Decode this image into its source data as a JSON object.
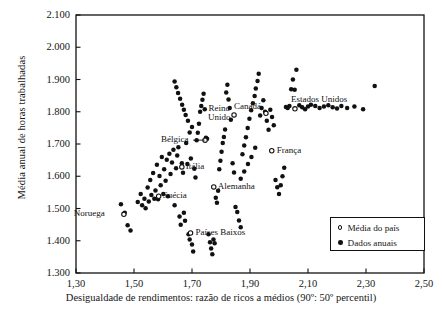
{
  "chart_data": {
    "type": "scatter",
    "title": "",
    "xlabel": "Desigualdade de rendimentos: razão de ricos a médios (90º: 50º percentil)",
    "ylabel": "Média anual de horas trabalhadas",
    "xlim": [
      1.3,
      2.5
    ],
    "ylim": [
      1300,
      2100
    ],
    "xticks": [
      "1,30",
      "1,50",
      "1,70",
      "1,90",
      "2,10",
      "2,30",
      "2,50"
    ],
    "xtick_values": [
      1.3,
      1.5,
      1.7,
      1.9,
      2.1,
      2.3,
      2.5
    ],
    "yticks": [
      "1.300",
      "1.400",
      "1.500",
      "1.600",
      "1.700",
      "1.800",
      "1.900",
      "2.000",
      "2.100"
    ],
    "ytick_values": [
      1300,
      1400,
      1500,
      1600,
      1700,
      1800,
      1900,
      2000,
      2100
    ],
    "grid": false,
    "legend_position": "bottom-right",
    "legend": [
      {
        "marker": "open-circle",
        "label": "Média do país"
      },
      {
        "marker": "filled-circle",
        "label": "Dados anuais"
      }
    ],
    "country_means": [
      {
        "name": "Noruega",
        "x": 1.465,
        "y": 1482,
        "label_side": "left"
      },
      {
        "name": "Suécia",
        "x": 1.585,
        "y": 1538,
        "label_side": "right"
      },
      {
        "name": "Itália",
        "x": 1.665,
        "y": 1629,
        "label_side": "right"
      },
      {
        "name": "Bélgica",
        "x": 1.745,
        "y": 1712,
        "label_side": "left"
      },
      {
        "name": "Países Baixos",
        "x": 1.695,
        "y": 1424,
        "label_side": "right"
      },
      {
        "name": "Alemanha",
        "x": 1.775,
        "y": 1567,
        "label_side": "right"
      },
      {
        "name": "Reino Unido",
        "x": 1.845,
        "y": 1790,
        "label_side": "left"
      },
      {
        "name": "Canadá",
        "x": 1.955,
        "y": 1795,
        "label_side": "left"
      },
      {
        "name": "França",
        "x": 1.975,
        "y": 1679,
        "label_side": "right"
      },
      {
        "name": "Estados Unidos",
        "x": 2.055,
        "y": 1809,
        "label_side": "right"
      }
    ],
    "annual_points": [
      {
        "x": 1.455,
        "y": 1513
      },
      {
        "x": 1.468,
        "y": 1487
      },
      {
        "x": 1.478,
        "y": 1448
      },
      {
        "x": 1.488,
        "y": 1432
      },
      {
        "x": 1.513,
        "y": 1520
      },
      {
        "x": 1.523,
        "y": 1545
      },
      {
        "x": 1.528,
        "y": 1510
      },
      {
        "x": 1.536,
        "y": 1530
      },
      {
        "x": 1.54,
        "y": 1501
      },
      {
        "x": 1.547,
        "y": 1565
      },
      {
        "x": 1.551,
        "y": 1522
      },
      {
        "x": 1.556,
        "y": 1588
      },
      {
        "x": 1.56,
        "y": 1542
      },
      {
        "x": 1.566,
        "y": 1610
      },
      {
        "x": 1.57,
        "y": 1530
      },
      {
        "x": 1.574,
        "y": 1556
      },
      {
        "x": 1.579,
        "y": 1636
      },
      {
        "x": 1.583,
        "y": 1529
      },
      {
        "x": 1.588,
        "y": 1601
      },
      {
        "x": 1.592,
        "y": 1572
      },
      {
        "x": 1.596,
        "y": 1660
      },
      {
        "x": 1.601,
        "y": 1545
      },
      {
        "x": 1.604,
        "y": 1622
      },
      {
        "x": 1.609,
        "y": 1586
      },
      {
        "x": 1.613,
        "y": 1651
      },
      {
        "x": 1.617,
        "y": 1538
      },
      {
        "x": 1.622,
        "y": 1670
      },
      {
        "x": 1.626,
        "y": 1607
      },
      {
        "x": 1.631,
        "y": 1643
      },
      {
        "x": 1.636,
        "y": 1682
      },
      {
        "x": 1.64,
        "y": 1510
      },
      {
        "x": 1.645,
        "y": 1625
      },
      {
        "x": 1.649,
        "y": 1664
      },
      {
        "x": 1.653,
        "y": 1690
      },
      {
        "x": 1.657,
        "y": 1475
      },
      {
        "x": 1.661,
        "y": 1450
      },
      {
        "x": 1.665,
        "y": 1640
      },
      {
        "x": 1.669,
        "y": 1611
      },
      {
        "x": 1.672,
        "y": 1487
      },
      {
        "x": 1.676,
        "y": 1462
      },
      {
        "x": 1.68,
        "y": 1703
      },
      {
        "x": 1.684,
        "y": 1638
      },
      {
        "x": 1.688,
        "y": 1420
      },
      {
        "x": 1.692,
        "y": 1404
      },
      {
        "x": 1.696,
        "y": 1655
      },
      {
        "x": 1.7,
        "y": 1388
      },
      {
        "x": 1.704,
        "y": 1367
      },
      {
        "x": 1.708,
        "y": 1623
      },
      {
        "x": 1.712,
        "y": 1596
      },
      {
        "x": 1.716,
        "y": 1712
      },
      {
        "x": 1.72,
        "y": 1735
      },
      {
        "x": 1.724,
        "y": 1763
      },
      {
        "x": 1.728,
        "y": 1800
      },
      {
        "x": 1.732,
        "y": 1818
      },
      {
        "x": 1.736,
        "y": 1837
      },
      {
        "x": 1.74,
        "y": 1856
      },
      {
        "x": 1.744,
        "y": 1808
      },
      {
        "x": 1.748,
        "y": 1719
      },
      {
        "x": 1.752,
        "y": 1716
      },
      {
        "x": 1.757,
        "y": 1420
      },
      {
        "x": 1.762,
        "y": 1395
      },
      {
        "x": 1.766,
        "y": 1376
      },
      {
        "x": 1.77,
        "y": 1358
      },
      {
        "x": 1.774,
        "y": 1404
      },
      {
        "x": 1.778,
        "y": 1392
      },
      {
        "x": 1.782,
        "y": 1533
      },
      {
        "x": 1.786,
        "y": 1518
      },
      {
        "x": 1.79,
        "y": 1555
      },
      {
        "x": 1.794,
        "y": 1622
      },
      {
        "x": 1.798,
        "y": 1648
      },
      {
        "x": 1.802,
        "y": 1676
      },
      {
        "x": 1.806,
        "y": 1703
      },
      {
        "x": 1.81,
        "y": 1722
      },
      {
        "x": 1.814,
        "y": 1745
      },
      {
        "x": 1.818,
        "y": 1860
      },
      {
        "x": 1.822,
        "y": 1884
      },
      {
        "x": 1.826,
        "y": 1838
      },
      {
        "x": 1.83,
        "y": 1812
      },
      {
        "x": 1.834,
        "y": 1775
      },
      {
        "x": 1.84,
        "y": 1640
      },
      {
        "x": 1.845,
        "y": 1612
      },
      {
        "x": 1.85,
        "y": 1505
      },
      {
        "x": 1.856,
        "y": 1489
      },
      {
        "x": 1.862,
        "y": 1463
      },
      {
        "x": 1.868,
        "y": 1442
      },
      {
        "x": 1.874,
        "y": 1668
      },
      {
        "x": 1.88,
        "y": 1695
      },
      {
        "x": 1.886,
        "y": 1721
      },
      {
        "x": 1.892,
        "y": 1750
      },
      {
        "x": 1.898,
        "y": 1778
      },
      {
        "x": 1.904,
        "y": 1805
      },
      {
        "x": 1.91,
        "y": 1826
      },
      {
        "x": 1.916,
        "y": 1849
      },
      {
        "x": 1.92,
        "y": 1872
      },
      {
        "x": 1.926,
        "y": 1895
      },
      {
        "x": 1.93,
        "y": 1918
      },
      {
        "x": 1.935,
        "y": 1788
      },
      {
        "x": 1.94,
        "y": 1812
      },
      {
        "x": 1.946,
        "y": 1836
      },
      {
        "x": 1.952,
        "y": 1800
      },
      {
        "x": 1.958,
        "y": 1772
      },
      {
        "x": 1.964,
        "y": 1744
      },
      {
        "x": 1.97,
        "y": 1806
      },
      {
        "x": 1.976,
        "y": 1784
      },
      {
        "x": 1.982,
        "y": 1758
      },
      {
        "x": 1.988,
        "y": 1588
      },
      {
        "x": 1.994,
        "y": 1566
      },
      {
        "x": 2.0,
        "y": 1545
      },
      {
        "x": 2.006,
        "y": 1572
      },
      {
        "x": 2.012,
        "y": 1600
      },
      {
        "x": 2.018,
        "y": 1626
      },
      {
        "x": 2.024,
        "y": 1815
      },
      {
        "x": 2.03,
        "y": 1812
      },
      {
        "x": 2.036,
        "y": 1818
      },
      {
        "x": 2.042,
        "y": 1870
      },
      {
        "x": 2.048,
        "y": 1900
      },
      {
        "x": 2.054,
        "y": 1868
      },
      {
        "x": 2.06,
        "y": 1930
      },
      {
        "x": 2.07,
        "y": 1820
      },
      {
        "x": 2.08,
        "y": 1814
      },
      {
        "x": 2.09,
        "y": 1808
      },
      {
        "x": 2.1,
        "y": 1816
      },
      {
        "x": 2.11,
        "y": 1822
      },
      {
        "x": 2.125,
        "y": 1818
      },
      {
        "x": 2.14,
        "y": 1812
      },
      {
        "x": 2.155,
        "y": 1816
      },
      {
        "x": 2.17,
        "y": 1820
      },
      {
        "x": 2.185,
        "y": 1814
      },
      {
        "x": 2.2,
        "y": 1810
      },
      {
        "x": 2.215,
        "y": 1818
      },
      {
        "x": 2.235,
        "y": 1812
      },
      {
        "x": 2.26,
        "y": 1816
      },
      {
        "x": 2.29,
        "y": 1808
      },
      {
        "x": 2.33,
        "y": 1880
      },
      {
        "x": 1.918,
        "y": 1688
      },
      {
        "x": 1.905,
        "y": 1660
      },
      {
        "x": 1.893,
        "y": 1638
      },
      {
        "x": 1.88,
        "y": 1615
      },
      {
        "x": 1.868,
        "y": 1592
      },
      {
        "x": 1.7,
        "y": 1753
      },
      {
        "x": 1.692,
        "y": 1736
      },
      {
        "x": 1.686,
        "y": 1772
      },
      {
        "x": 1.678,
        "y": 1790
      },
      {
        "x": 1.672,
        "y": 1806
      },
      {
        "x": 1.666,
        "y": 1822
      },
      {
        "x": 1.659,
        "y": 1840
      },
      {
        "x": 1.652,
        "y": 1858
      },
      {
        "x": 1.646,
        "y": 1876
      },
      {
        "x": 1.64,
        "y": 1894
      }
    ]
  }
}
